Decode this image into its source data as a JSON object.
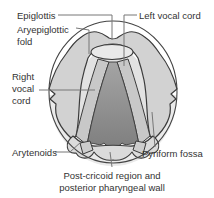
{
  "figure": {
    "type": "anatomical-diagram",
    "labels": {
      "epiglottis": "Epiglottis",
      "aryepiglottic_fold": "Aryepiglottic fold",
      "left_vocal_cord": "Left vocal cord",
      "right_vocal_cord": "Right vocal cord",
      "arytenoids": "Arytenoids",
      "pyriform_fossa": "Pyriform fossa",
      "post_cricoid": "Post-cricoid region and posterior pharyngeal wall"
    },
    "colors": {
      "background": "#ffffff",
      "outline": "#3b3b3b",
      "leader_line": "#777777",
      "band_fill": "#d2d2d2",
      "vestibule_fill": "#e2e2e2",
      "pharynx_fill": "#eaeaea",
      "cord_fill": "#c8c8c8",
      "glottis_top": "#a6a6a6",
      "glottis_bottom": "#7f7f7f",
      "arytenoid_fill": "#dbdbdb",
      "text": "#333333"
    }
  }
}
